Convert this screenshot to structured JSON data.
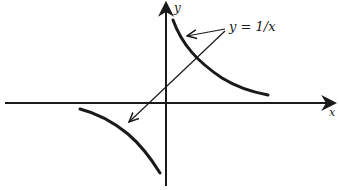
{
  "diagram": {
    "type": "function-graph",
    "function": "y = 1/x",
    "labels": {
      "equation": "y = 1/x",
      "x_axis": "x",
      "y_axis": "y"
    },
    "colors": {
      "ink": "#1a1a1a",
      "background": "#ffffff"
    },
    "components": [
      "x-axis with arrow pointing right",
      "y-axis with arrow pointing up",
      "hyperbola branch in first quadrant",
      "hyperbola branch in third quadrant",
      "two leader arrows from label to each branch"
    ]
  }
}
